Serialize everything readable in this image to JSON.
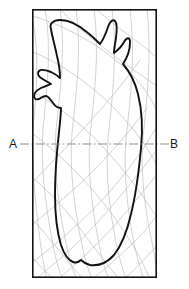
{
  "figure": {
    "type": "technical-cross-section-diagram",
    "title": "",
    "background_color": "#ffffff",
    "frame": {
      "name": "section-border",
      "x": 32,
      "y": 9,
      "width": 125,
      "height": 269,
      "stroke_color": "#141414",
      "stroke_width": 1.6
    },
    "section_line": {
      "name": "section-line-A-B",
      "style": "dash-dot",
      "stroke_color": "#7d7d7d",
      "stroke_width": 0.9,
      "y": 144,
      "x_start": 20,
      "x_end": 169
    },
    "labels": {
      "left": {
        "text": "A",
        "x": 12,
        "y": 148,
        "leader_x1": 20,
        "leader_x2": 31
      },
      "right": {
        "text": "B",
        "x": 172,
        "y": 148,
        "leader_x1": 158,
        "leader_x2": 169
      }
    },
    "contour": {
      "name": "primary-outline",
      "description": "irregular closed organic contour with two upper horn projections and a lobed left flank",
      "stroke_color": "#111111",
      "stroke_width": 1.9,
      "fill": "none"
    },
    "grid": {
      "name": "background-curve-grid",
      "description": "faint curvilinear construction / isoline grid",
      "stroke_color": "#b4b4b4",
      "stroke_width": 0.6,
      "curve_count": 18
    }
  }
}
